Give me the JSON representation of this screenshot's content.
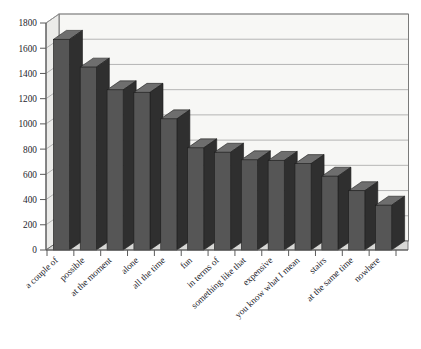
{
  "chart_data": {
    "type": "bar",
    "title": "",
    "xlabel": "",
    "ylabel": "",
    "ylim": [
      0,
      1800
    ],
    "yticks": [
      0,
      200,
      400,
      600,
      800,
      1000,
      1200,
      1400,
      1600,
      1800
    ],
    "grid": true,
    "legend": null,
    "style": "3d-bars",
    "categories": [
      "a couple of",
      "possible",
      "at the moment",
      "alone",
      "all the time",
      "fun",
      "in terms of",
      "something like that",
      "expensive",
      "you know what I mean",
      "stairs",
      "at the same time",
      "nowhere"
    ],
    "values": [
      1670,
      1450,
      1270,
      1250,
      1040,
      810,
      775,
      715,
      710,
      685,
      585,
      470,
      355
    ],
    "colors": {
      "bar_front": "#565656",
      "bar_side": "#2f2f2f",
      "bar_top": "#6e6e6e",
      "plot_back": "#f7f7f5",
      "plot_floor": "#d8d8d6",
      "plot_wall": "#ebebe9",
      "gridline": "#9a9a9a",
      "axis": "#5a5a5a",
      "text": "#23232b"
    }
  },
  "axis": {
    "y_tick_labels": [
      "1800",
      "1600",
      "1400",
      "1200",
      "1000",
      "800",
      "600",
      "400",
      "200",
      "0"
    ]
  }
}
